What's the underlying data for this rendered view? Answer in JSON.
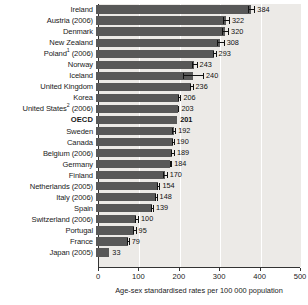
{
  "chart_data": {
    "type": "bar",
    "orientation": "horizontal",
    "title": "",
    "subtitle": "",
    "xlabel": "Age-sex standardised rates per 100 000 population",
    "ylabel": "",
    "xlim": [
      0,
      500
    ],
    "xticks": [
      0,
      100,
      200,
      300,
      400,
      500
    ],
    "xtick_labels": [
      "0",
      "100",
      "200",
      "300",
      "400",
      "500"
    ],
    "grid": "vertical",
    "legend": "none",
    "bar_color": "#585858",
    "plot_background": "#eceae7",
    "categories": [
      "Ireland",
      "Austria (2006)",
      "Denmark",
      "New Zealand",
      "Poland¹ (2006)",
      "Norway",
      "Iceland",
      "United Kingdom",
      "Korea",
      "United States² (2006)",
      "OECD",
      "Sweden",
      "Canada",
      "Belgium (2006)",
      "Germany",
      "Finland",
      "Netherlands (2005)",
      "Italy (2006)",
      "Spain",
      "Switzerland (2006)",
      "Portugal",
      "France",
      "Japan (2005)"
    ],
    "values": [
      384,
      322,
      320,
      308,
      293,
      243,
      240,
      236,
      206,
      203,
      201,
      192,
      190,
      189,
      184,
      170,
      154,
      148,
      139,
      100,
      95,
      79,
      33
    ],
    "highlight_category": "OECD"
  },
  "rows": [
    {
      "label": "Ireland",
      "sup": "",
      "value": 384,
      "value_text": "384",
      "highlight": false,
      "err_low": 376,
      "err_high": 392
    },
    {
      "label": "Austria (2006)",
      "sup": "",
      "value": 322,
      "value_text": "322",
      "highlight": false,
      "err_low": 315,
      "err_high": 329
    },
    {
      "label": "Denmark",
      "sup": "",
      "value": 320,
      "value_text": "320",
      "highlight": false,
      "err_low": 313,
      "err_high": 327
    },
    {
      "label": "New Zealand",
      "sup": "",
      "value": 308,
      "value_text": "308",
      "highlight": false,
      "err_low": 300,
      "err_high": 316
    },
    {
      "label": "Poland (2006)",
      "sup": "1",
      "value": 293,
      "value_text": "293",
      "highlight": false,
      "err_low": 290,
      "err_high": 296
    },
    {
      "label": "Norway",
      "sup": "",
      "value": 243,
      "value_text": "243",
      "highlight": false,
      "err_low": 237,
      "err_high": 249
    },
    {
      "label": "Iceland",
      "sup": "",
      "value": 240,
      "value_text": "240",
      "highlight": false,
      "err_low": 215,
      "err_high": 265
    },
    {
      "label": "United Kingdom",
      "sup": "",
      "value": 236,
      "value_text": "236",
      "highlight": false,
      "err_low": 233,
      "err_high": 239
    },
    {
      "label": "Korea",
      "sup": "",
      "value": 206,
      "value_text": "206",
      "highlight": false,
      "err_low": 203,
      "err_high": 209
    },
    {
      "label": "United States (2006)",
      "sup": "2",
      "value": 203,
      "value_text": "203",
      "highlight": false,
      "err_low": 202,
      "err_high": 204
    },
    {
      "label": "OECD",
      "sup": "",
      "value": 201,
      "value_text": "201",
      "highlight": true,
      "err_low": null,
      "err_high": null
    },
    {
      "label": "Sweden",
      "sup": "",
      "value": 192,
      "value_text": "192",
      "highlight": false,
      "err_low": 188,
      "err_high": 196
    },
    {
      "label": "Canada",
      "sup": "",
      "value": 190,
      "value_text": "190",
      "highlight": false,
      "err_low": 188,
      "err_high": 192
    },
    {
      "label": "Belgium (2006)",
      "sup": "",
      "value": 189,
      "value_text": "189",
      "highlight": false,
      "err_low": 185,
      "err_high": 193
    },
    {
      "label": "Germany",
      "sup": "",
      "value": 184,
      "value_text": "184",
      "highlight": false,
      "err_low": 182,
      "err_high": 186
    },
    {
      "label": "Finland",
      "sup": "",
      "value": 170,
      "value_text": "170",
      "highlight": false,
      "err_low": 165,
      "err_high": 175
    },
    {
      "label": "Netherlands (2005)",
      "sup": "",
      "value": 154,
      "value_text": "154",
      "highlight": false,
      "err_low": 151,
      "err_high": 157
    },
    {
      "label": "Italy (2006)",
      "sup": "",
      "value": 148,
      "value_text": "148",
      "highlight": false,
      "err_low": 146,
      "err_high": 150
    },
    {
      "label": "Spain",
      "sup": "",
      "value": 139,
      "value_text": "139",
      "highlight": false,
      "err_low": 137,
      "err_high": 141
    },
    {
      "label": "Switzerland (2006)",
      "sup": "",
      "value": 100,
      "value_text": "100",
      "highlight": false,
      "err_low": 96,
      "err_high": 104
    },
    {
      "label": "Portugal",
      "sup": "",
      "value": 95,
      "value_text": "95",
      "highlight": false,
      "err_low": 92,
      "err_high": 98
    },
    {
      "label": "France",
      "sup": "",
      "value": 79,
      "value_text": "79",
      "highlight": false,
      "err_low": 77,
      "err_high": 81
    },
    {
      "label": "Japan (2005)",
      "sup": "",
      "value": 33,
      "value_text": "33",
      "highlight": false,
      "err_low": null,
      "err_high": null
    }
  ],
  "axis": {
    "caption": "Age-sex standardised rates per 100 000 population",
    "ticks": [
      "0",
      "100",
      "200",
      "300",
      "400",
      "500"
    ]
  }
}
